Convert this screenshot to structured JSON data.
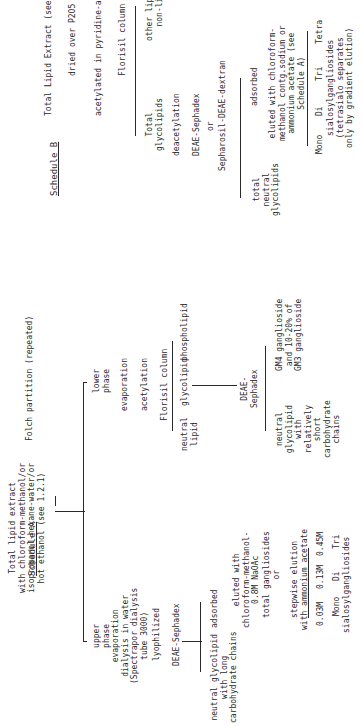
{
  "schedule_a": {
    "heading": "Schedule A",
    "start": "Total lipid extract\nwith chloroform-methanol/or\nisopropanol-hexane-water/or\nhot ethanol (see 1.2.1)",
    "folch": "Folch partition (repeated)",
    "upper_phase": "upper\nphase\nevaporation\ndialysis in water\n(Spectrapor dialysis\ntube 3000)",
    "lyophilized": "lyophilized",
    "deae_sephadex": "DEAE-Sephadex",
    "neutral_long": "neutral glycolipid\nwith long\ncarbohydrate chains",
    "adsorbed": "adsorbed",
    "eluted": "eluted with\nchloroform-methanol-\n0.8M NaOAc",
    "total_gangliosides": "total gangliosides\nor",
    "stepwise": "stepwise elution\nwith ammonium acetate",
    "conc_1": "0.03M",
    "conc_2": "0.13M",
    "conc_3": "0.45M",
    "mono": "Mono",
    "di": "Di",
    "tri": "Tri",
    "sialosyl": "sialosylgangliosides",
    "lower_phase": "lower\nphase",
    "evaporation": "evaporation",
    "acetylation": "acetylation",
    "florisil": "Florisil column",
    "neutral_lipid": "neutral\nlipid",
    "glycolipid": "glycolipid",
    "phospholipid": "phospholipid",
    "deae_sephadex_2": "DEAE-\nSephadex",
    "neutral_short": "neutral\nglycolipid\nwith\nrelatively\nshort\ncarbohydrate\nchains",
    "gm_gangliosides": "GM4 ganglioside\nand 10-20% of\nGM3 ganglioside"
  },
  "schedule_b": {
    "heading": "Schedule B",
    "start": "Total Lipid Extract (see 1.2.1)",
    "dried": "dried over P2O5 vacuum desicator",
    "acetylated": "acetylated in pyridine-acetic anhydride",
    "florisil": "Florisil column",
    "total_glycolipids": "Total\nglycolipids",
    "other_lipids": "other lipids and\nnon-lipids",
    "deacetylation": "deacetylation",
    "deae_sephadex": "DEAE-Sephadex",
    "or": "or",
    "sepharosil": "Sepharosil-DEAE-dextran",
    "total_neutral": "total\nneutral\nglycolipids",
    "adsorbed": "adsorbed",
    "eluted": "eluted with chloroform-\nmethanol contg.sodium or\nammonium acetate (see\nSchedule A)",
    "mono": "Mono",
    "di": "Di",
    "tri": "Tri",
    "tetra": "Tetra",
    "sialosyl": "sialosylgangliosides\n(tetrasialo separates\nonly by gradient elution)"
  }
}
